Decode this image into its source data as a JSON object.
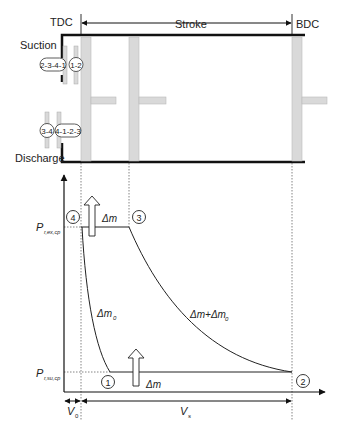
{
  "top": {
    "tdc_label": "TDC",
    "stroke_label": "Stroke",
    "bdc_label": "BDC",
    "suction_label": "Suction",
    "discharge_label": "Discharge",
    "suction_valve_tags": [
      "2-3-4-1",
      "1-2"
    ],
    "discharge_valve_tags": [
      "3-4",
      "4-1-2-3"
    ]
  },
  "bottom": {
    "p_ex_symbol": "P",
    "p_ex_subscript": "r,ex,cp",
    "p_su_symbol": "P",
    "p_su_subscript": "r,su,cp",
    "points": [
      "1",
      "2",
      "3",
      "4"
    ],
    "dm_top_label": "Δm",
    "dm_bottom_label": "Δm",
    "dm0_label_main": "Δm",
    "dm0_label_sub": "0",
    "dm_dm0_label_main": "Δm+Δm",
    "dm_dm0_label_sub": "0",
    "v0_symbol": "V",
    "v0_sub": "0",
    "vs_symbol": "V",
    "vs_sub": "s"
  },
  "colors": {
    "line": "#111111",
    "piston_fill": "#d9d9d9",
    "piston_stroke": "#b5b5b5",
    "dashed": "#666666"
  }
}
